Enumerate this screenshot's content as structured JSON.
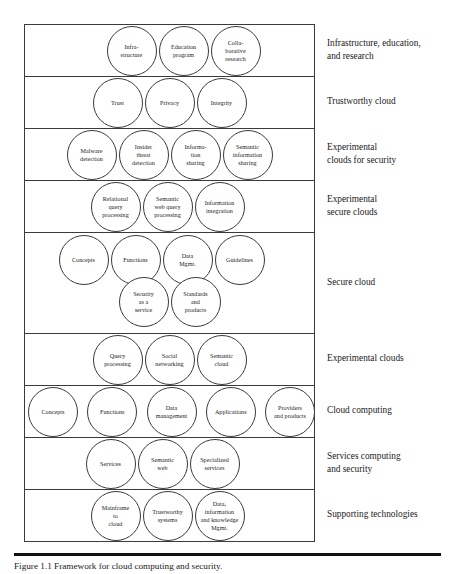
{
  "figure": {
    "caption": "Figure 1.1 Framework for cloud computing and security.",
    "layers": [
      {
        "id": "infrastructure-education-research",
        "label": "Infrastructure, education, and research",
        "nodes": [
          "Infra-\nstructure",
          "Education\nprogram",
          "Colla-\nborative\nresearch"
        ],
        "rows": [
          [
            "Infra-\nstructure",
            "Education\nprogram",
            "Colla-\nborative\nresearch"
          ]
        ]
      },
      {
        "id": "trustworthy-cloud",
        "label": "Trustworthy cloud",
        "nodes": [
          "Trust",
          "Privacy",
          "Integrity"
        ],
        "rows": [
          [
            "Trust",
            "Privacy",
            "Integrity"
          ]
        ]
      },
      {
        "id": "experimental-clouds-for-security",
        "label": "Experimental clouds for security",
        "nodes": [
          "Malware\ndetection",
          "Insider\nthreat\ndetection",
          "Informa-\ntion\nsharing",
          "Semantic\ninformation\nsharing"
        ],
        "rows": [
          [
            "Malware\ndetection",
            "Insider\nthreat\ndetection",
            "Informa-\ntion\nsharing",
            "Semantic\ninformation\nsharing"
          ]
        ]
      },
      {
        "id": "experimental-secure-clouds",
        "label": "Experimental secure clouds",
        "nodes": [
          "Relational\nquery\nprocessing",
          "Semantic\nweb query\nprocessing",
          "Information\nintegration"
        ],
        "rows": [
          [
            "Relational\nquery\nprocessing",
            "Semantic\nweb query\nprocessing",
            "Information\nintegration"
          ]
        ]
      },
      {
        "id": "secure-cloud",
        "label": "Secure cloud",
        "nodes": [
          "Concepts",
          "Functions",
          "Data\nMgmt.",
          "Guidelines",
          "Security\nas a\nservice",
          "Standards\nand\nproducts"
        ],
        "rows": [
          [
            "Concepts",
            "Functions",
            "Data\nMgmt.",
            "Guidelines"
          ],
          [
            "Security\nas a\nservice",
            "Standards\nand\nproducts"
          ]
        ]
      },
      {
        "id": "experimental-clouds",
        "label": "Experimental clouds",
        "nodes": [
          "Query\nprocessing",
          "Social\nnetworking",
          "Semantic\ncloud"
        ],
        "rows": [
          [
            "Query\nprocessing",
            "Social\nnetworking",
            "Semantic\ncloud"
          ]
        ]
      },
      {
        "id": "cloud-computing",
        "label": "Cloud computing",
        "nodes": [
          "Concepts",
          "Functions",
          "Data\nmanagement",
          "Applications",
          "Providers\nand products"
        ],
        "rows": [
          [
            "Concepts",
            "Functions",
            "Data\nmanagement",
            "Applications",
            "Providers\nand products"
          ]
        ]
      },
      {
        "id": "services-computing-and-security",
        "label": "Services computing and security",
        "nodes": [
          "Services",
          "Semantic\nweb",
          "Specialized\nservices"
        ],
        "rows": [
          [
            "Services",
            "Semantic\nweb",
            "Specialized\nservices"
          ]
        ]
      },
      {
        "id": "supporting-technologies",
        "label": "Supporting technologies",
        "nodes": [
          "Mainframe\nto\ncloud",
          "Trustworthy\nsystems",
          "Data,\ninformation\nand knowledge\nMgmt."
        ],
        "rows": [
          [
            "Mainframe\nto\ncloud",
            "Trustworthy\nsystems",
            "Data,\ninformation\nand knowledge\nMgmt."
          ]
        ]
      }
    ]
  },
  "layout": {
    "layer_tops": [
      0,
      52,
      104,
      156,
      208,
      309,
      361,
      413,
      465
    ],
    "layer_heights": [
      52,
      52,
      52,
      52,
      101,
      52,
      52,
      52,
      52
    ],
    "label_lines": [
      [
        "Infrastructure, education,",
        "and research"
      ],
      [
        "Trustworthy cloud"
      ],
      [
        "Experimental",
        "clouds for security"
      ],
      [
        "Experimental",
        "secure clouds"
      ],
      [
        "Secure cloud"
      ],
      [
        "Experimental clouds"
      ],
      [
        "Cloud computing"
      ],
      [
        "Services computing",
        "and security"
      ],
      [
        "Supporting technologies"
      ]
    ],
    "row_offsets": [
      [
        [
          1,
          50
        ]
      ],
      [
        [
          1,
          50
        ]
      ],
      [
        [
          1,
          50
        ]
      ],
      [
        [
          1,
          50
        ]
      ],
      [
        [
          2,
          50
        ],
        [
          44,
          50
        ]
      ],
      [
        [
          1,
          50
        ]
      ],
      [
        [
          1,
          50
        ]
      ],
      [
        [
          1,
          50
        ]
      ],
      [
        [
          1,
          50
        ]
      ]
    ],
    "row_justify": [
      [
        "center"
      ],
      [
        "center"
      ],
      [
        "center"
      ],
      [
        "center"
      ],
      [
        "center",
        "center"
      ],
      [
        "center"
      ],
      [
        "space-between"
      ],
      [
        "center"
      ],
      [
        "center"
      ]
    ],
    "row_shift": [
      [
        14
      ],
      [
        0
      ],
      [
        0
      ],
      [
        -2
      ],
      [
        -8,
        0
      ],
      [
        0
      ],
      [
        0
      ],
      [
        -7
      ],
      [
        -2
      ]
    ]
  }
}
